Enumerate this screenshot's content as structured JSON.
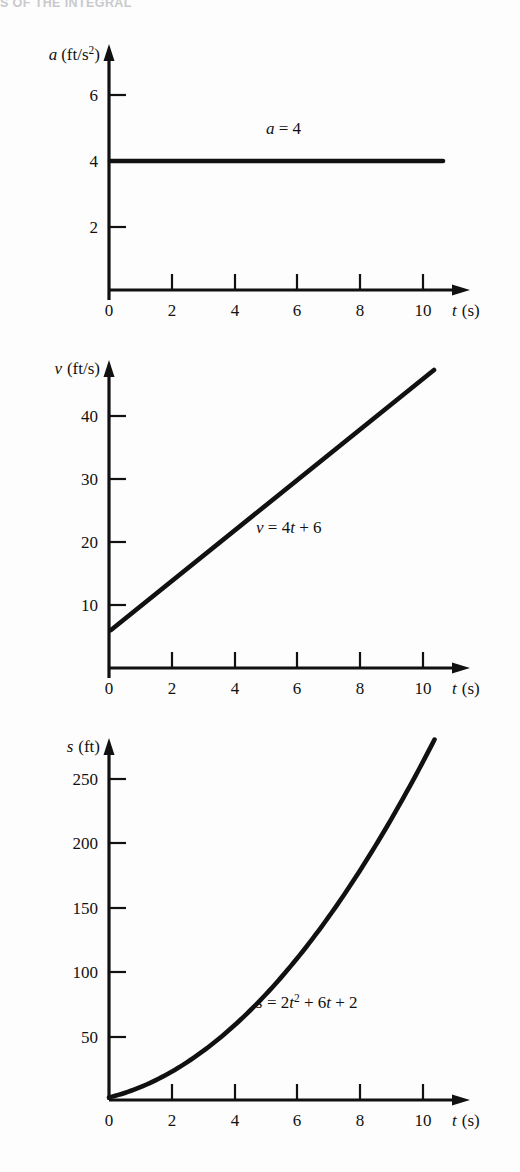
{
  "page": {
    "running_head": "S OF THE INTEGRAL"
  },
  "figures": [
    {
      "id": "acceleration",
      "name": "acceleration-vs-time-graph",
      "y_axis_title": {
        "symbol": "a",
        "units": "(ft/s",
        "exponent": "2",
        "units_close": ")"
      },
      "x_axis_title": {
        "symbol": "t",
        "units": "(s)"
      },
      "y_ticks": [
        "2",
        "4",
        "6"
      ],
      "y_tick_values": [
        2,
        4,
        6
      ],
      "x_ticks": [
        "0",
        "2",
        "4",
        "6",
        "8",
        "10"
      ],
      "x_tick_values": [
        0,
        2,
        4,
        6,
        8,
        10
      ],
      "curve_label": {
        "lhs": "a",
        "rhs": " = 4"
      }
    },
    {
      "id": "velocity",
      "name": "velocity-vs-time-graph",
      "y_axis_title": {
        "symbol": "v",
        "units": "(ft/s)"
      },
      "x_axis_title": {
        "symbol": "t",
        "units": "(s)"
      },
      "y_ticks": [
        "10",
        "20",
        "30",
        "40"
      ],
      "y_tick_values": [
        10,
        20,
        30,
        40
      ],
      "x_ticks": [
        "0",
        "2",
        "4",
        "6",
        "8",
        "10"
      ],
      "x_tick_values": [
        0,
        2,
        4,
        6,
        8,
        10
      ],
      "curve_label": {
        "lhs": "v",
        "mid": " = 4",
        "var": "t",
        "rhs": " + 6"
      }
    },
    {
      "id": "position",
      "name": "position-vs-time-graph",
      "y_axis_title": {
        "symbol": "s",
        "units": "(ft)"
      },
      "x_axis_title": {
        "symbol": "t",
        "units": "(s)"
      },
      "y_ticks": [
        "50",
        "100",
        "150",
        "200",
        "250"
      ],
      "y_tick_values": [
        50,
        100,
        150,
        200,
        250
      ],
      "x_ticks": [
        "0",
        "2",
        "4",
        "6",
        "8",
        "10"
      ],
      "x_tick_values": [
        0,
        2,
        4,
        6,
        8,
        10
      ],
      "curve_label": {
        "lhs": "s",
        "mid": " = 2",
        "var": "t",
        "exp": "2",
        "mid2": " + 6",
        "var2": "t",
        "rhs": " + 2"
      }
    }
  ],
  "chart_data": [
    {
      "type": "line",
      "title": "Acceleration vs time",
      "equation": "a = 4",
      "xlabel": "t (s)",
      "ylabel": "a (ft/s^2)",
      "xlim": [
        0,
        10.4
      ],
      "ylim": [
        0,
        7.2
      ],
      "xticks": [
        0,
        2,
        4,
        6,
        8,
        10
      ],
      "yticks": [
        2,
        4,
        6
      ],
      "grid": false,
      "legend": "none",
      "x": [
        0,
        2,
        4,
        6,
        8,
        10
      ],
      "y": [
        4,
        4,
        4,
        4,
        4,
        4
      ],
      "annotations": [
        {
          "text": "a = 4",
          "x": 6.2,
          "y": 5.0
        }
      ]
    },
    {
      "type": "line",
      "title": "Velocity vs time",
      "equation": "v = 4t + 6",
      "xlabel": "t (s)",
      "ylabel": "v (ft/s)",
      "xlim": [
        0,
        10.4
      ],
      "ylim": [
        0,
        48
      ],
      "xticks": [
        0,
        2,
        4,
        6,
        8,
        10
      ],
      "yticks": [
        10,
        20,
        30,
        40
      ],
      "grid": false,
      "legend": "none",
      "x": [
        0,
        2,
        4,
        6,
        8,
        10
      ],
      "y": [
        6,
        14,
        22,
        30,
        38,
        46
      ],
      "annotations": [
        {
          "text": "v = 4t + 6",
          "x": 5.2,
          "y": 22
        }
      ]
    },
    {
      "type": "line",
      "title": "Position vs time",
      "equation": "s = 2t^2 + 6t + 2",
      "xlabel": "t (s)",
      "ylabel": "s (ft)",
      "xlim": [
        0,
        10.4
      ],
      "ylim": [
        0,
        290
      ],
      "xticks": [
        0,
        2,
        4,
        6,
        8,
        10
      ],
      "yticks": [
        50,
        100,
        150,
        200,
        250
      ],
      "grid": false,
      "legend": "none",
      "x": [
        0,
        1,
        2,
        3,
        4,
        5,
        6,
        7,
        8,
        9,
        10
      ],
      "y": [
        2,
        10,
        22,
        38,
        58,
        82,
        110,
        142,
        178,
        218,
        262
      ],
      "annotations": [
        {
          "text": "s = 2t^2 + 6t + 2",
          "x": 5.0,
          "y": 72
        }
      ]
    }
  ]
}
